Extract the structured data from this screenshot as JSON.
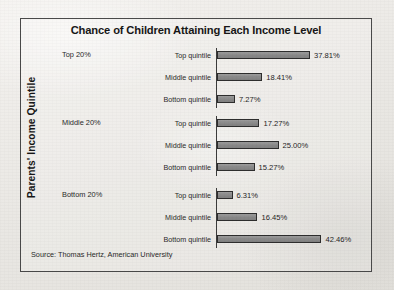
{
  "chart_data": {
    "type": "bar",
    "title": "Chance of Children Attaining Each Income Level",
    "ylabel": "Parents' Income Quintile",
    "xlabel": "",
    "orientation": "horizontal",
    "grid": false,
    "legend": "none",
    "xlim": [
      0,
      45
    ],
    "value_suffix": "%",
    "source": "Source: Thomas Hertz, American University",
    "groups": [
      {
        "name": "Top 20%",
        "categories": [
          "Top quintile",
          "Middle quintile",
          "Bottom quintile"
        ],
        "values": [
          37.81,
          18.41,
          7.27
        ],
        "labels": [
          "37.81%",
          "18.41%",
          "7.27%"
        ]
      },
      {
        "name": "Middle 20%",
        "categories": [
          "Top quintile",
          "Middle quintile",
          "Bottom quintile"
        ],
        "values": [
          17.27,
          25.0,
          15.27
        ],
        "labels": [
          "17.27%",
          "25.00%",
          "15.27%"
        ]
      },
      {
        "name": "Bottom 20%",
        "categories": [
          "Top quintile",
          "Middle quintile",
          "Bottom quintile"
        ],
        "values": [
          6.31,
          16.45,
          42.46
        ],
        "labels": [
          "6.31%",
          "16.45%",
          "42.46%"
        ]
      }
    ],
    "colors": {
      "bar_fill": "#8b8b8b",
      "bar_border": "#2e2e2e",
      "frame": "#4a4a4a",
      "text": "#1f1f1f",
      "paper": "#eceae6"
    }
  }
}
